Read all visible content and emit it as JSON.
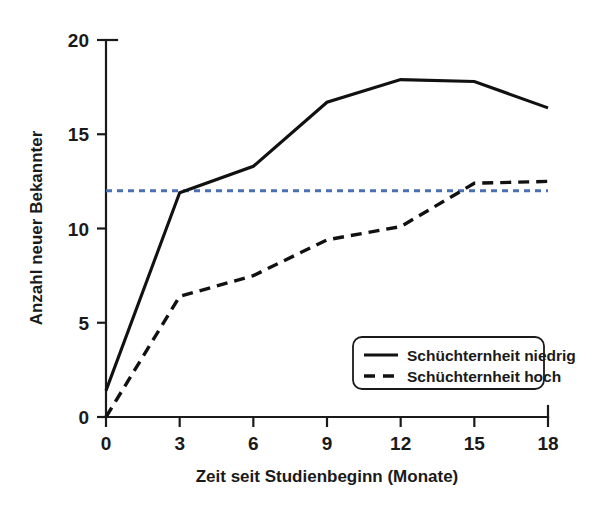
{
  "chart_data": {
    "type": "line",
    "title": "",
    "xlabel": "Zeit seit Studienbeginn (Monate)",
    "ylabel": "Anzahl neuer Bekannter",
    "xlim": [
      0,
      18
    ],
    "ylim": [
      0,
      20
    ],
    "xticks": [
      0,
      3,
      6,
      9,
      12,
      15,
      18
    ],
    "yticks": [
      0,
      5,
      10,
      15,
      20
    ],
    "xtick_labels": [
      "0",
      "3",
      "6",
      "9",
      "12",
      "15",
      "18"
    ],
    "ytick_labels": [
      "0",
      "5",
      "10",
      "15",
      "20"
    ],
    "grid": false,
    "legend_position": "lower right",
    "x": [
      0,
      3,
      6,
      9,
      12,
      15,
      18
    ],
    "series": [
      {
        "name": "Schüchternheit niedrig",
        "style": "solid",
        "color": "#111111",
        "values": [
          1.4,
          11.9,
          13.3,
          16.7,
          17.9,
          17.8,
          16.4
        ]
      },
      {
        "name": "Schüchternheit hoch",
        "style": "dashed",
        "color": "#111111",
        "values": [
          0.0,
          6.4,
          7.5,
          9.4,
          10.1,
          12.4,
          12.5
        ]
      }
    ],
    "reference_line": {
      "name": "reference-level",
      "style": "dotted",
      "color": "#4a6fb5",
      "orientation": "horizontal",
      "value": 12
    },
    "annotations": []
  },
  "legend": {
    "items": [
      {
        "label": "Schüchternheit niedrig",
        "style": "solid"
      },
      {
        "label": "Schüchternheit hoch",
        "style": "dashed"
      }
    ]
  },
  "axes": {
    "y_title": "Anzahl neuer Bekannter",
    "x_title": "Zeit seit Studienbeginn (Monate)"
  }
}
